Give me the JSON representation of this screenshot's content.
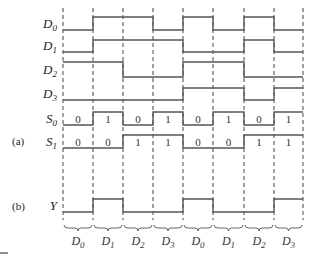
{
  "figure": {
    "part_a_tag": "(a)",
    "part_b_tag": "(b)",
    "boundaries_x": [
      63,
      93,
      123,
      153,
      183,
      213,
      244,
      274,
      303
    ],
    "signals": [
      {
        "name": "D",
        "sub": "0",
        "hi_y": 17,
        "lo_y": 30,
        "levels": [
          0,
          1,
          1,
          0,
          1,
          0,
          1,
          0
        ]
      },
      {
        "name": "D",
        "sub": "1",
        "hi_y": 40,
        "lo_y": 52,
        "levels": [
          0,
          1,
          1,
          1,
          0,
          0,
          1,
          0
        ]
      },
      {
        "name": "D",
        "sub": "2",
        "hi_y": 62,
        "lo_y": 77,
        "levels": [
          1,
          1,
          0,
          0,
          1,
          1,
          0,
          0
        ]
      },
      {
        "name": "D",
        "sub": "3",
        "hi_y": 88,
        "lo_y": 100,
        "levels": [
          0,
          0,
          0,
          0,
          1,
          1,
          0,
          1
        ]
      },
      {
        "name": "S",
        "sub": "0",
        "hi_y": 112,
        "lo_y": 125,
        "levels": [
          0,
          1,
          0,
          1,
          0,
          1,
          0,
          1
        ],
        "values": [
          "0",
          "1",
          "0",
          "1",
          "0",
          "1",
          "0",
          "1"
        ]
      },
      {
        "name": "S",
        "sub": "1",
        "hi_y": 135,
        "lo_y": 148,
        "levels": [
          0,
          0,
          1,
          1,
          0,
          0,
          1,
          1
        ],
        "values": [
          "0",
          "0",
          "1",
          "1",
          "0",
          "0",
          "1",
          "1"
        ]
      }
    ],
    "output": {
      "name": "Y",
      "hi_y": 199,
      "lo_y": 212,
      "levels": [
        0,
        1,
        0,
        0,
        1,
        0,
        0,
        1
      ]
    },
    "brace_labels": [
      {
        "name": "D",
        "sub": "0"
      },
      {
        "name": "D",
        "sub": "1"
      },
      {
        "name": "D",
        "sub": "2"
      },
      {
        "name": "D",
        "sub": "3"
      },
      {
        "name": "D",
        "sub": "0"
      },
      {
        "name": "D",
        "sub": "1"
      },
      {
        "name": "D",
        "sub": "2"
      },
      {
        "name": "D",
        "sub": "3"
      }
    ]
  }
}
